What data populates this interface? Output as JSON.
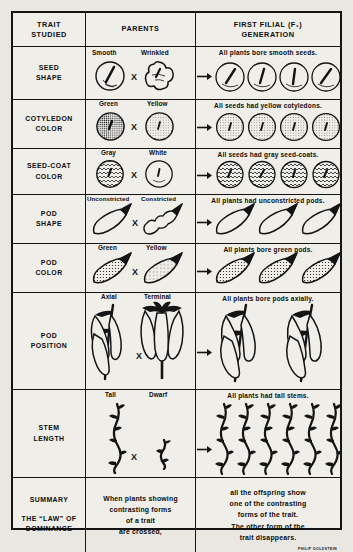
{
  "credit": "PHILIP GOLDSTEIN",
  "header": {
    "trait": "TRAIT\nSTUDIED",
    "trait_line1": "TRAIT",
    "trait_line2": "STUDIED",
    "parents": "PARENTS",
    "f1_line1": "FIRST FILIAL (F₁)",
    "f1_line2": "GENERATION"
  },
  "cross_symbol": "X",
  "rows": [
    {
      "trait_line1": "SEED",
      "trait_line2": "SHAPE",
      "parent_dominant": "Smooth",
      "parent_recessive": "Wrinkled",
      "f1_caption": "All plants bore smooth seeds.",
      "f1_count": 4,
      "art": "seed-shape"
    },
    {
      "trait_line1": "COTYLEDON",
      "trait_line2": "COLOR",
      "parent_dominant": "Green",
      "parent_recessive": "Yellow",
      "f1_caption": "All seeds had yellow cotyledons.",
      "f1_count": 4,
      "art": "cotyledon-color"
    },
    {
      "trait_line1": "SEED-COAT",
      "trait_line2": "COLOR",
      "parent_dominant": "Gray",
      "parent_recessive": "White",
      "f1_caption": "All seeds had gray seed-coats.",
      "f1_count": 4,
      "art": "seed-coat-color"
    },
    {
      "trait_line1": "POD",
      "trait_line2": "SHAPE",
      "parent_dominant": "Unconstricted",
      "parent_recessive": "Constricted",
      "f1_caption": "All plants had unconstricted pods.",
      "f1_count": 3,
      "art": "pod-shape"
    },
    {
      "trait_line1": "POD",
      "trait_line2": "COLOR",
      "parent_dominant": "Green",
      "parent_recessive": "Yellow",
      "f1_caption": "All plants bore green pods.",
      "f1_count": 3,
      "art": "pod-color"
    },
    {
      "trait_line1": "POD",
      "trait_line2": "POSITION",
      "parent_dominant": "Axial",
      "parent_recessive": "Terminal",
      "f1_caption": "All plants bore pods axially.",
      "f1_count": 2,
      "art": "pod-position"
    },
    {
      "trait_line1": "STEM",
      "trait_line2": "LENGTH",
      "parent_dominant": "Tall",
      "parent_recessive": "Dwarf",
      "f1_caption": "All plants had tall stems.",
      "f1_count": 6,
      "art": "stem-length"
    }
  ],
  "summary": {
    "trait_line1": "SUMMARY",
    "trait_line2": "THE “LAW” OF",
    "trait_line3": "DOMINANCE",
    "parents_l1": "When plants showing",
    "parents_l2": "contrasting forms",
    "parents_l3": "of a trait",
    "parents_l4": "are crossed,",
    "f1_l1": "all the offspring show",
    "f1_l2": "one of the contrasting",
    "f1_l3": "forms of the trait.",
    "f1_l4": "The other form of the",
    "f1_l5": "trait disappears."
  },
  "colors": {
    "ink": "#141414",
    "paper": "#efeee9",
    "page": "#e9e7e2"
  }
}
